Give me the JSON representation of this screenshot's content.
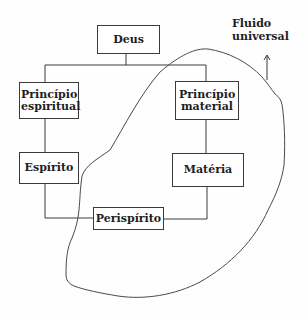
{
  "diagram": {
    "nodes": {
      "deus": {
        "label": "Deus"
      },
      "principio_espiritual": {
        "label": "Princípio espiritual"
      },
      "principio_material": {
        "label": "Princípio material"
      },
      "espirito": {
        "label": "Espírito"
      },
      "materia": {
        "label": "Matéria"
      },
      "perispirito": {
        "label": "Perispírito"
      }
    },
    "annotation": {
      "line1": "Fluido",
      "line2": "universal"
    },
    "edges": [
      [
        "Deus",
        "Princípio espiritual"
      ],
      [
        "Deus",
        "Princípio material"
      ],
      [
        "Princípio espiritual",
        "Espírito"
      ],
      [
        "Princípio material",
        "Matéria"
      ],
      [
        "Espírito",
        "Perispírito"
      ],
      [
        "Matéria",
        "Perispírito"
      ]
    ],
    "region": "Fluido universal (hand-drawn outline enclosing Princípio material, Matéria, Perispírito)",
    "colors": {
      "line": "#3a3a3a",
      "text": "#1e1e1e",
      "background": "#ffffff"
    }
  }
}
